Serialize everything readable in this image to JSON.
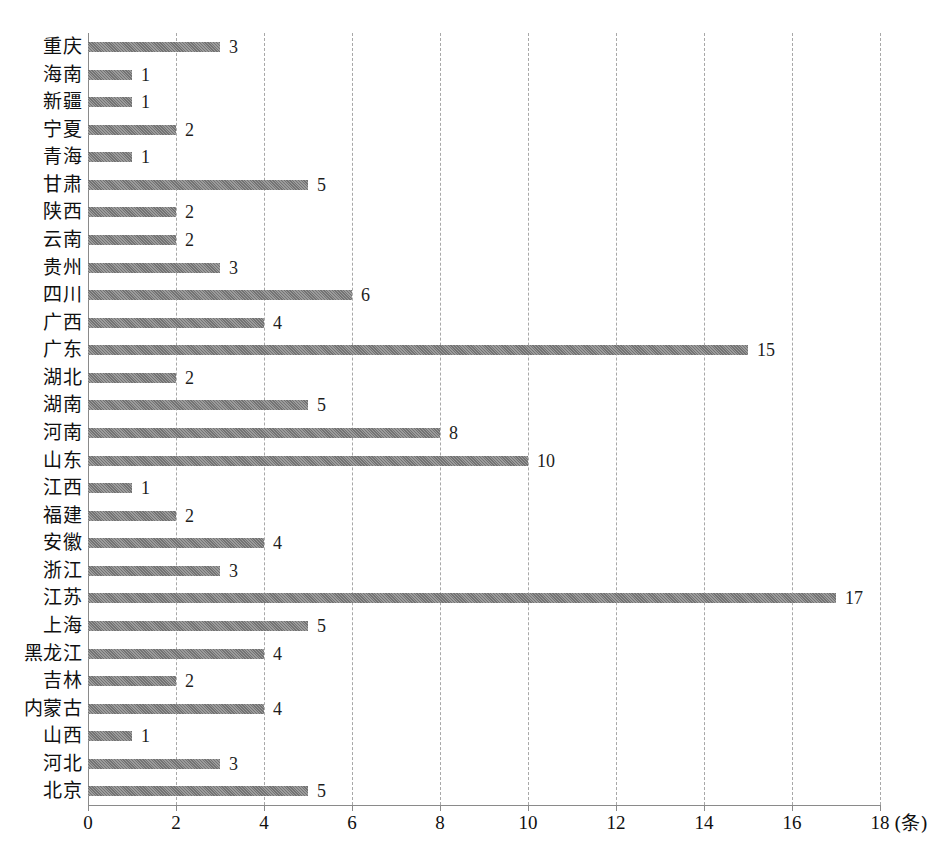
{
  "chart_data": {
    "type": "bar",
    "orientation": "horizontal",
    "title": "",
    "subtitle": "",
    "xlabel": "",
    "ylabel": "",
    "unit_label": "(条)",
    "xlim": [
      0,
      18
    ],
    "xticks": [
      0,
      2,
      4,
      6,
      8,
      10,
      12,
      14,
      16,
      18
    ],
    "xtick_labels": [
      "0",
      "2",
      "4",
      "6",
      "8",
      "10",
      "12",
      "14",
      "16",
      "18"
    ],
    "grid": true,
    "grid_axis": "x",
    "grid_style": "dashed",
    "legend": false,
    "legend_position": "none",
    "bar_color": "#808080",
    "show_data_labels": true,
    "categories": [
      "重庆",
      "海南",
      "新疆",
      "宁夏",
      "青海",
      "甘肃",
      "陕西",
      "云南",
      "贵州",
      "四川",
      "广西",
      "广东",
      "湖北",
      "湖南",
      "河南",
      "山东",
      "江西",
      "福建",
      "安徽",
      "浙江",
      "江苏",
      "上海",
      "黑龙江",
      "吉林",
      "内蒙古",
      "山西",
      "河北",
      "北京"
    ],
    "values": [
      3,
      1,
      1,
      2,
      1,
      5,
      2,
      2,
      3,
      6,
      4,
      15,
      2,
      5,
      8,
      10,
      1,
      2,
      4,
      3,
      17,
      5,
      4,
      2,
      4,
      1,
      3,
      5
    ],
    "value_labels": [
      "3",
      "1",
      "1",
      "2",
      "1",
      "5",
      "2",
      "2",
      "3",
      "6",
      "4",
      "15",
      "2",
      "5",
      "8",
      "10",
      "1",
      "2",
      "4",
      "3",
      "17",
      "5",
      "4",
      "2",
      "4",
      "1",
      "3",
      "5"
    ]
  }
}
